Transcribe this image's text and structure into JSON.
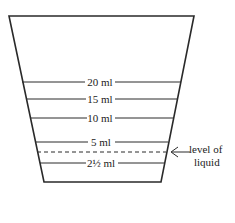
{
  "diagram": {
    "colors": {
      "line": "#2a2a2a",
      "text": "#222222",
      "background": "#ffffff"
    },
    "cup": {
      "top_left": [
        9,
        16
      ],
      "top_right": [
        194,
        16
      ],
      "bottom_left": [
        44,
        182
      ],
      "bottom_right": [
        161,
        182
      ]
    },
    "graduations": [
      {
        "label": "20 ml",
        "y": 82
      },
      {
        "label": "15 ml",
        "y": 99
      },
      {
        "label": "10 ml",
        "y": 118
      },
      {
        "label": "5 ml",
        "y": 142
      },
      {
        "label": "2½ ml",
        "y": 163
      }
    ],
    "liquid_level": {
      "y": 152,
      "style": "dashed",
      "annotation_line1": "level of",
      "annotation_line2": "liquid",
      "arrow": "left-arrow"
    }
  }
}
